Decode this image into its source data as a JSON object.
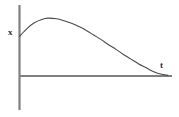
{
  "figure": {
    "background_color": "#ffffff",
    "width": 179,
    "height": 117,
    "axis_color": "#808080",
    "curve_color": "#4a4a4a"
  },
  "labels": {
    "vertical_axis": "x",
    "horizontal_axis": "t"
  },
  "chart_data": {
    "type": "line",
    "title": "",
    "subtitle": "",
    "xlabel": "t",
    "ylabel": "x",
    "grid": false,
    "legend": null,
    "annotations": [],
    "xlim": [
      0,
      1
    ],
    "ylim": [
      0,
      1
    ],
    "xtick_labels": [],
    "ytick_labels": [],
    "series": [
      {
        "name": "x(t)",
        "x": [
          0.0,
          0.05,
          0.1,
          0.15,
          0.19,
          0.25,
          0.3,
          0.35,
          0.4,
          0.45,
          0.5,
          0.55,
          0.6,
          0.65,
          0.7,
          0.75,
          0.8,
          0.85,
          0.9,
          0.95,
          1.0
        ],
        "y": [
          0.61,
          0.73,
          0.82,
          0.87,
          0.89,
          0.88,
          0.85,
          0.81,
          0.76,
          0.7,
          0.63,
          0.56,
          0.48,
          0.41,
          0.33,
          0.26,
          0.19,
          0.13,
          0.07,
          0.03,
          0.01
        ]
      }
    ]
  }
}
